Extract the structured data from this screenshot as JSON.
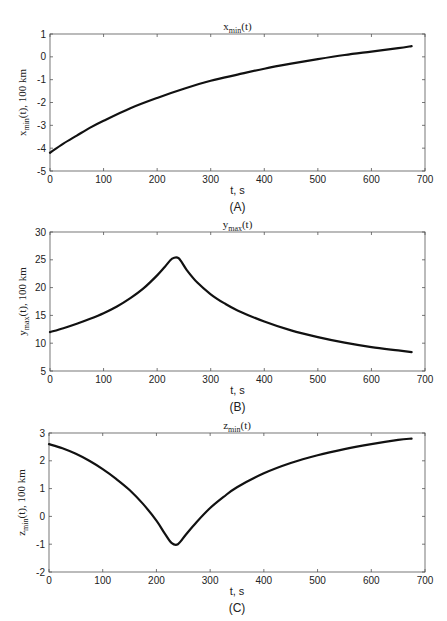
{
  "chart_data": [
    {
      "id": "A",
      "type": "line",
      "title": "x_min(t)",
      "title_main": "x",
      "title_sub": "min",
      "title_suffix": "(t)",
      "xlabel": "t, s",
      "ylabel": "x_min(t), 100 km",
      "ylabel_main": "x",
      "ylabel_sub": "min",
      "ylabel_suffix": "(t), 100 km",
      "caption": "(A)",
      "xlim": [
        0,
        700
      ],
      "ylim": [
        -5,
        1
      ],
      "xticks": [
        0,
        100,
        200,
        300,
        400,
        500,
        600,
        700
      ],
      "yticks": [
        -5,
        -4,
        -3,
        -2,
        -1,
        0,
        1
      ],
      "grid": false,
      "series": [
        {
          "name": "x_min",
          "x": [
            0,
            25,
            50,
            75,
            100,
            150,
            200,
            250,
            300,
            350,
            400,
            450,
            500,
            550,
            600,
            650,
            675
          ],
          "values": [
            -4.2,
            -3.8,
            -3.45,
            -3.1,
            -2.8,
            -2.25,
            -1.8,
            -1.4,
            -1.05,
            -0.78,
            -0.52,
            -0.3,
            -0.1,
            0.08,
            0.23,
            0.38,
            0.47
          ]
        }
      ]
    },
    {
      "id": "B",
      "type": "line",
      "title": "y_max(t)",
      "title_main": "y",
      "title_sub": "max",
      "title_suffix": "(t)",
      "xlabel": "t, s",
      "ylabel": "y_max(t), 100 km",
      "ylabel_main": "y",
      "ylabel_sub": "max",
      "ylabel_suffix": "(t), 100 km",
      "caption": "(B)",
      "xlim": [
        0,
        700
      ],
      "ylim": [
        5,
        30
      ],
      "xticks": [
        0,
        100,
        200,
        300,
        400,
        500,
        600,
        700
      ],
      "yticks": [
        5,
        10,
        15,
        20,
        25,
        30
      ],
      "grid": false,
      "series": [
        {
          "name": "y_max",
          "x": [
            0,
            25,
            50,
            75,
            100,
            125,
            150,
            175,
            200,
            215,
            228,
            240,
            255,
            275,
            300,
            325,
            350,
            400,
            450,
            500,
            550,
            600,
            650,
            675
          ],
          "values": [
            12.0,
            12.7,
            13.5,
            14.4,
            15.4,
            16.6,
            18.1,
            19.9,
            22.2,
            23.8,
            25.2,
            25.3,
            23.2,
            20.9,
            18.8,
            17.2,
            15.9,
            13.9,
            12.3,
            11.1,
            10.1,
            9.3,
            8.7,
            8.4
          ]
        }
      ]
    },
    {
      "id": "C",
      "type": "line",
      "title": "z_min(t)",
      "title_main": "z",
      "title_sub": "min",
      "title_suffix": "(t)",
      "xlabel": "t, s",
      "ylabel": "z_min(t), 100 km",
      "ylabel_main": "z",
      "ylabel_sub": "min",
      "ylabel_suffix": "(t), 100 km",
      "caption": "(C)",
      "xlim": [
        0,
        700
      ],
      "ylim": [
        -2,
        3
      ],
      "xticks": [
        0,
        100,
        200,
        300,
        400,
        500,
        600,
        700
      ],
      "yticks": [
        -2,
        -1,
        0,
        1,
        2,
        3
      ],
      "grid": false,
      "series": [
        {
          "name": "z_min",
          "x": [
            0,
            25,
            50,
            75,
            100,
            125,
            150,
            175,
            200,
            215,
            228,
            240,
            255,
            275,
            300,
            325,
            350,
            400,
            450,
            500,
            550,
            600,
            650,
            675
          ],
          "values": [
            2.6,
            2.45,
            2.25,
            2.0,
            1.7,
            1.35,
            0.95,
            0.45,
            -0.15,
            -0.6,
            -0.95,
            -1.0,
            -0.65,
            -0.2,
            0.3,
            0.7,
            1.05,
            1.55,
            1.92,
            2.2,
            2.42,
            2.6,
            2.75,
            2.8
          ]
        }
      ]
    }
  ]
}
